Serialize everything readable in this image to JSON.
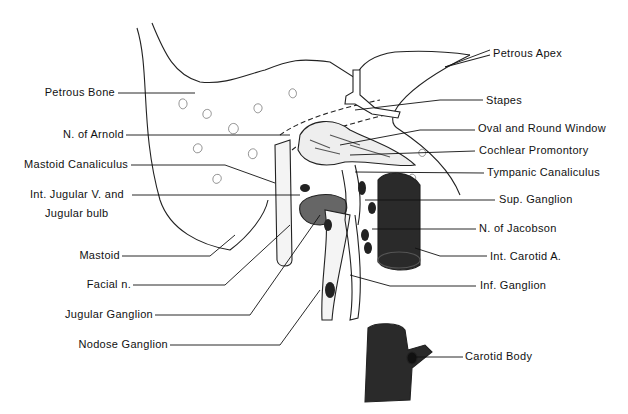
{
  "labels_left": [
    {
      "id": "petrous-bone",
      "text": "Petrous Bone"
    },
    {
      "id": "n-of-arnold",
      "text": "N. of Arnold"
    },
    {
      "id": "mastoid-canaliculus",
      "text": "Mastoid Canaliculus"
    },
    {
      "id": "int-jugular-v",
      "text": "Int. Jugular V. and"
    },
    {
      "id": "jugular-bulb",
      "text": "Jugular bulb"
    },
    {
      "id": "mastoid",
      "text": "Mastoid"
    },
    {
      "id": "facial-n",
      "text": "Facial n."
    },
    {
      "id": "jugular-ganglion",
      "text": "Jugular Ganglion"
    },
    {
      "id": "nodose-ganglion",
      "text": "Nodose Ganglion"
    }
  ],
  "labels_right": [
    {
      "id": "petrous-apex",
      "text": "Petrous Apex"
    },
    {
      "id": "stapes",
      "text": "Stapes"
    },
    {
      "id": "oval-round-window",
      "text": "Oval and Round Window"
    },
    {
      "id": "cochlear-promontory",
      "text": "Cochlear Promontory"
    },
    {
      "id": "tympanic-canaliculus",
      "text": "Tympanic Canaliculus"
    },
    {
      "id": "sup-ganglion",
      "text": "Sup. Ganglion"
    },
    {
      "id": "n-of-jacobson",
      "text": "N. of Jacobson"
    },
    {
      "id": "int-carotid-a",
      "text": "Int. Carotid A."
    },
    {
      "id": "inf-ganglion",
      "text": "Inf. Ganglion"
    },
    {
      "id": "carotid-body",
      "text": "Carotid Body"
    }
  ],
  "colors": {
    "ink": "#111111",
    "dark_fill": "#2a2a2a",
    "mid_fill": "#6a6a6a",
    "paper": "#ffffff"
  }
}
